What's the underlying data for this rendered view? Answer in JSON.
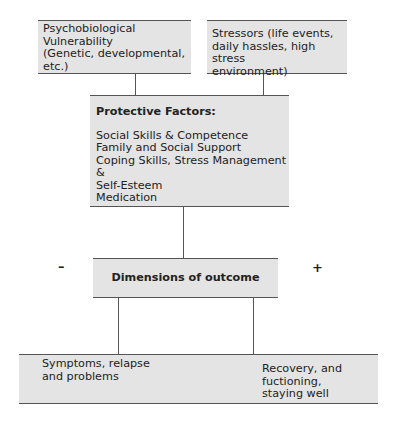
{
  "diagram": {
    "vulnerability_box": {
      "lines": [
        "Psychobiological",
        "Vulnerability",
        "(Genetic, developmental,",
        "etc.)"
      ]
    },
    "stressors_box": {
      "lines": [
        "Stressors (life events,",
        "daily hassles, high stress",
        "environment)"
      ]
    },
    "protective_box": {
      "title": "Protective Factors:",
      "items": [
        "Social Skills & Competence",
        "Family and Social Support",
        "Coping Skills, Stress Management &",
        "Self-Esteem",
        "Medication"
      ]
    },
    "outcome_box": {
      "title": "Dimensions of outcome",
      "minus_sign": "–",
      "plus_sign": "+"
    },
    "results_box": {
      "negative_lines": [
        "Symptoms, relapse",
        "and problems"
      ],
      "positive_lines": [
        "Recovery, and",
        "fuctioning,",
        "staying well"
      ]
    },
    "colors": {
      "box_fill": "#e4e4e4",
      "border": "#555555"
    }
  }
}
